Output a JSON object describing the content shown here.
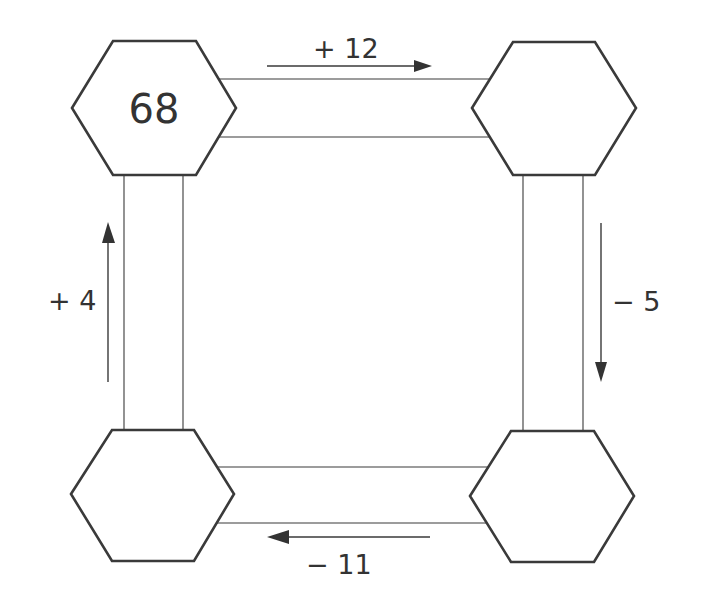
{
  "diagram": {
    "hexagons": [
      {
        "position": "top-left",
        "value": "68"
      },
      {
        "position": "top-right",
        "value": ""
      },
      {
        "position": "bottom-right",
        "value": ""
      },
      {
        "position": "bottom-left",
        "value": ""
      }
    ],
    "operations": [
      {
        "from": "top-left",
        "to": "top-right",
        "label": "+ 12",
        "direction": "right"
      },
      {
        "from": "top-right",
        "to": "bottom-right",
        "label": "− 5",
        "direction": "down"
      },
      {
        "from": "bottom-right",
        "to": "bottom-left",
        "label": "− 11",
        "direction": "left"
      },
      {
        "from": "bottom-left",
        "to": "top-left",
        "label": "+ 4",
        "direction": "up"
      }
    ],
    "colors": {
      "stroke": "#3a3a3a",
      "background": "#ffffff",
      "text": "#333333"
    }
  }
}
